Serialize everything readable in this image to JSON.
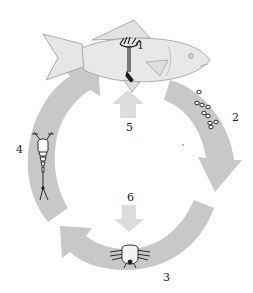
{
  "diagram": {
    "type": "life-cycle",
    "colors": {
      "background": "#ffffff",
      "cycle_arrow": "#c8c8c8",
      "fish_fill": "#e6e6e6",
      "fish_stroke": "#9a9a9a",
      "inner_arrow": "#dcdcdc",
      "organism_ink": "#1a1a1a",
      "label_text": "#222222"
    },
    "host": {
      "name": "fish-host"
    },
    "stages": [
      {
        "number": "1",
        "name": "adult-parasite-on-fish"
      },
      {
        "number": "2",
        "name": "eggs"
      },
      {
        "number": "3",
        "name": "larva"
      },
      {
        "number": "4",
        "name": "free-swimming-stage"
      },
      {
        "number": "5",
        "name": "infection-arrow-into-host"
      },
      {
        "number": "6",
        "name": "arrow-to-larva"
      }
    ],
    "labels": {
      "l1": "1",
      "l2": "2",
      "l3": "3",
      "l4": "4",
      "l5": "5",
      "l6": "6"
    },
    "cycle_direction": "clockwise"
  }
}
